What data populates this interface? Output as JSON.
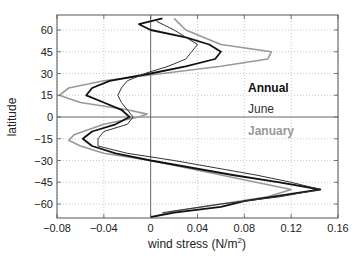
{
  "chart_data": {
    "type": "line",
    "title": "",
    "xlabel": "wind stress (N/m",
    "xlabel_sup": "2",
    "xlabel_close": ")",
    "ylabel": "latitude",
    "xlim": [
      -0.08,
      0.16
    ],
    "ylim": [
      -70,
      70
    ],
    "grid": true,
    "grid_style": "dotted",
    "xticks": [
      -0.08,
      -0.04,
      0,
      0.04,
      0.08,
      0.12,
      0.16
    ],
    "xtick_labels": [
      "−0.08",
      "−0.04",
      "0",
      "0.04",
      "0.08",
      "0.12",
      "0.16"
    ],
    "yticks": [
      60,
      45,
      30,
      15,
      0,
      -15,
      -30,
      -45,
      -60
    ],
    "ytick_labels": [
      "60",
      "45",
      "30",
      "15",
      "0",
      "−15",
      "−30",
      "−45",
      "−60"
    ],
    "reference_lines": {
      "x": 0,
      "y": 0
    },
    "legend": {
      "position": "inside right, near equator",
      "entries": [
        {
          "label": "Annual",
          "color": "#111111",
          "bold": true
        },
        {
          "label": "June",
          "color": "#333333",
          "bold": false
        },
        {
          "label": "January",
          "color": "#999999",
          "bold": false
        }
      ]
    },
    "series": [
      {
        "name": "January",
        "color": "#999999",
        "width": 1.6,
        "points": [
          [
            0.0,
            -69
          ],
          [
            0.02,
            -65
          ],
          [
            0.06,
            -60
          ],
          [
            0.1,
            -55
          ],
          [
            0.12,
            -50
          ],
          [
            0.09,
            -45
          ],
          [
            0.06,
            -40
          ],
          [
            0.03,
            -35
          ],
          [
            0.0,
            -30
          ],
          [
            -0.04,
            -25
          ],
          [
            -0.06,
            -20
          ],
          [
            -0.07,
            -16
          ],
          [
            -0.065,
            -12
          ],
          [
            -0.04,
            -5
          ],
          [
            -0.01,
            0
          ],
          [
            -0.003,
            2
          ],
          [
            -0.02,
            5
          ],
          [
            -0.06,
            10
          ],
          [
            -0.078,
            15
          ],
          [
            -0.07,
            20
          ],
          [
            -0.04,
            25
          ],
          [
            0.01,
            30
          ],
          [
            0.06,
            35
          ],
          [
            0.1,
            40
          ],
          [
            0.103,
            45
          ],
          [
            0.06,
            50
          ],
          [
            0.03,
            60
          ],
          [
            0.02,
            68
          ]
        ]
      },
      {
        "name": "Annual",
        "color": "#111111",
        "width": 1.8,
        "points": [
          [
            0.0,
            -69
          ],
          [
            0.02,
            -66
          ],
          [
            0.06,
            -62
          ],
          [
            0.08,
            -58
          ],
          [
            0.12,
            -53
          ],
          [
            0.145,
            -50
          ],
          [
            0.11,
            -45
          ],
          [
            0.07,
            -40
          ],
          [
            0.0,
            -30
          ],
          [
            -0.03,
            -25
          ],
          [
            -0.05,
            -20
          ],
          [
            -0.058,
            -15
          ],
          [
            -0.05,
            -10
          ],
          [
            -0.03,
            -5
          ],
          [
            -0.018,
            0
          ],
          [
            -0.025,
            5
          ],
          [
            -0.04,
            10
          ],
          [
            -0.055,
            15
          ],
          [
            -0.05,
            20
          ],
          [
            -0.035,
            25
          ],
          [
            0.0,
            30
          ],
          [
            0.03,
            35
          ],
          [
            0.055,
            40
          ],
          [
            0.06,
            45
          ],
          [
            0.05,
            50
          ],
          [
            0.03,
            55
          ],
          [
            0.0,
            60
          ],
          [
            -0.01,
            64
          ],
          [
            0.01,
            68
          ]
        ]
      },
      {
        "name": "June",
        "color": "#333333",
        "width": 1.0,
        "points": [
          [
            0.01,
            -66
          ],
          [
            0.06,
            -60
          ],
          [
            0.11,
            -55
          ],
          [
            0.145,
            -50
          ],
          [
            0.12,
            -45
          ],
          [
            0.09,
            -40
          ],
          [
            0.02,
            -30
          ],
          [
            -0.02,
            -25
          ],
          [
            -0.045,
            -20
          ],
          [
            -0.045,
            -15
          ],
          [
            -0.04,
            -10
          ],
          [
            -0.02,
            -5
          ],
          [
            -0.015,
            0
          ],
          [
            -0.02,
            5
          ],
          [
            -0.025,
            10
          ],
          [
            -0.028,
            15
          ],
          [
            -0.025,
            20
          ],
          [
            -0.02,
            25
          ],
          [
            -0.005,
            30
          ],
          [
            0.015,
            35
          ],
          [
            0.03,
            40
          ],
          [
            0.035,
            45
          ],
          [
            0.04,
            50
          ],
          [
            0.02,
            60
          ],
          [
            0.005,
            66
          ]
        ]
      }
    ]
  }
}
